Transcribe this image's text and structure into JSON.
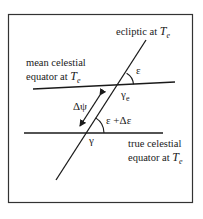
{
  "diagram": {
    "labels": {
      "ecliptic": {
        "text": "ecliptic at ",
        "var": "T",
        "sub": "e"
      },
      "mean_equator_line1": "mean celestial",
      "mean_equator_line2": {
        "text": "equator at ",
        "var": "T",
        "sub": "e"
      },
      "true_equator_line1": "true celestial",
      "true_equator_line2": {
        "text": "equator at ",
        "var": "T",
        "sub": "e"
      },
      "epsilon": "ε",
      "gamma_e": {
        "symbol": "γ",
        "sub": "e"
      },
      "delta_psi": "Δψ",
      "epsilon_plus_delta": "ε +Δε",
      "gamma": "γ"
    },
    "geometry": {
      "frame": {
        "x": 8,
        "y": 14,
        "w": 185,
        "h": 189
      },
      "ecliptic": {
        "x1": 146,
        "y1": 40,
        "x2": 56,
        "y2": 180
      },
      "mean_equator": {
        "x1": 33,
        "y1": 89,
        "x2": 175,
        "y2": 82
      },
      "true_equator": {
        "x1": 24,
        "y1": 133,
        "x2": 163,
        "y2": 133
      },
      "delta_psi_arrow": {
        "x1": 104,
        "y1": 89,
        "x2": 77,
        "y2": 131
      }
    },
    "colors": {
      "line": "#1a1a1a",
      "frame": "#333333",
      "background": "#ffffff"
    }
  }
}
